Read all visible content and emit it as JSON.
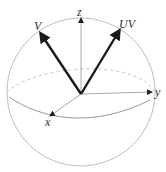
{
  "diagram": {
    "type": "bloch-sphere",
    "colors": {
      "sphere": "#bdbdbd",
      "axis": "#a8a8a8",
      "vector": "#1a1a1a",
      "label": "#333333"
    },
    "axes": [
      {
        "name": "z",
        "label": "z"
      },
      {
        "name": "y",
        "label": "y"
      },
      {
        "name": "x",
        "label": "x"
      }
    ],
    "vectors": [
      {
        "name": "V",
        "label": "V"
      },
      {
        "name": "UV",
        "label": "UV"
      }
    ]
  }
}
